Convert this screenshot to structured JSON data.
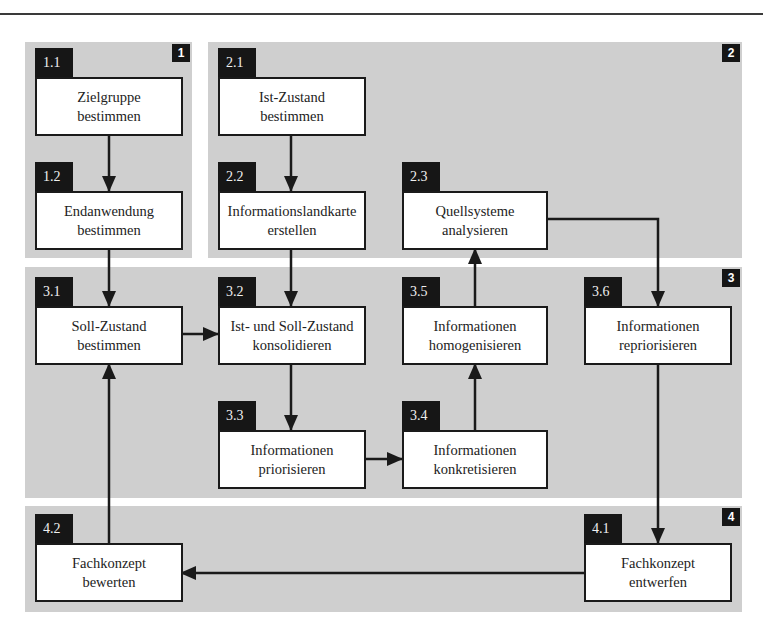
{
  "regions": [
    {
      "id": "1",
      "label": "1"
    },
    {
      "id": "2",
      "label": "2"
    },
    {
      "id": "3",
      "label": "3"
    },
    {
      "id": "4",
      "label": "4"
    }
  ],
  "steps": {
    "s1_1": {
      "number": "1.1",
      "line1": "Zielgruppe",
      "line2": "bestimmen"
    },
    "s1_2": {
      "number": "1.2",
      "line1": "Endanwendung",
      "line2": "bestimmen"
    },
    "s2_1": {
      "number": "2.1",
      "line1": "Ist-Zustand",
      "line2": "bestimmen"
    },
    "s2_2": {
      "number": "2.2",
      "line1": "Informationslandkarte",
      "line2": "erstellen"
    },
    "s2_3": {
      "number": "2.3",
      "line1": "Quellsysteme",
      "line2": "analysieren"
    },
    "s3_1": {
      "number": "3.1",
      "line1": "Soll-Zustand",
      "line2": "bestimmen"
    },
    "s3_2": {
      "number": "3.2",
      "line1": "Ist- und Soll-Zustand",
      "line2": "konsolidieren"
    },
    "s3_3": {
      "number": "3.3",
      "line1": "Informationen",
      "line2": "priorisieren"
    },
    "s3_4": {
      "number": "3.4",
      "line1": "Informationen",
      "line2": "konkretisieren"
    },
    "s3_5": {
      "number": "3.5",
      "line1": "Informationen",
      "line2": "homogenisieren"
    },
    "s3_6": {
      "number": "3.6",
      "line1": "Informationen",
      "line2": "repriorisieren"
    },
    "s4_1": {
      "number": "4.1",
      "line1": "Fachkonzept",
      "line2": "entwerfen"
    },
    "s4_2": {
      "number": "4.2",
      "line1": "Fachkonzept",
      "line2": "bewerten"
    }
  },
  "flows": [
    {
      "from": "1.1",
      "to": "1.2"
    },
    {
      "from": "1.2",
      "to": "3.1"
    },
    {
      "from": "2.1",
      "to": "2.2"
    },
    {
      "from": "2.2",
      "to": "3.2"
    },
    {
      "from": "3.1",
      "to": "3.2"
    },
    {
      "from": "3.2",
      "to": "3.3"
    },
    {
      "from": "3.3",
      "to": "3.4"
    },
    {
      "from": "3.4",
      "to": "3.5"
    },
    {
      "from": "3.5",
      "to": "2.3"
    },
    {
      "from": "2.3",
      "to": "3.6"
    },
    {
      "from": "3.6",
      "to": "4.1"
    },
    {
      "from": "4.1",
      "to": "4.2"
    },
    {
      "from": "4.2",
      "to": "3.1"
    }
  ]
}
